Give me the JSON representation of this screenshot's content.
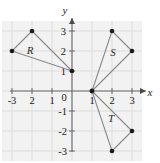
{
  "figure": {
    "title": "",
    "type": "coordinate-plane-triangles",
    "axis_labels": {
      "x": "x",
      "y": "y"
    },
    "origin_label": "0",
    "x_ticks": [
      {
        "value": -3,
        "label": "-3"
      },
      {
        "value": -2,
        "label": "2"
      },
      {
        "value": -1,
        "label": "1"
      },
      {
        "value": 1,
        "label": "1"
      },
      {
        "value": 2,
        "label": "2"
      },
      {
        "value": 3,
        "label": "3"
      }
    ],
    "y_ticks": [
      {
        "value": 3,
        "label": "3"
      },
      {
        "value": 2,
        "label": "2"
      },
      {
        "value": 1,
        "label": "1"
      },
      {
        "value": -1,
        "label": "-1"
      },
      {
        "value": -2,
        "label": "-2"
      },
      {
        "value": -3,
        "label": "-3"
      }
    ],
    "x_range": [
      -3.6,
      3.9
    ],
    "y_range": [
      -3.6,
      3.6
    ],
    "grid": true,
    "colors": {
      "grid": "#d9d9d9",
      "plot_background": "#f2f2f2",
      "axis": "#6b6b6b",
      "shape_stroke": "#8a8a8a",
      "vertex": "#1a1a1a",
      "text": "#1a1a1a"
    },
    "shapes": [
      {
        "name": "R",
        "label": "R",
        "label_position": {
          "x": -2.1,
          "y": 2.05
        },
        "vertices": [
          {
            "x": -3,
            "y": 2
          },
          {
            "x": -2,
            "y": 3
          },
          {
            "x": 0,
            "y": 1
          }
        ]
      },
      {
        "name": "S",
        "label": "S",
        "label_position": {
          "x": 2.05,
          "y": 1.95
        },
        "vertices": [
          {
            "x": 1,
            "y": 0
          },
          {
            "x": 2,
            "y": 3
          },
          {
            "x": 3,
            "y": 2
          }
        ]
      },
      {
        "name": "T",
        "label": "T",
        "label_position": {
          "x": 1.95,
          "y": -1.35
        },
        "vertices": [
          {
            "x": 1,
            "y": 0
          },
          {
            "x": 3,
            "y": -2
          },
          {
            "x": 2,
            "y": -3
          }
        ]
      }
    ]
  }
}
